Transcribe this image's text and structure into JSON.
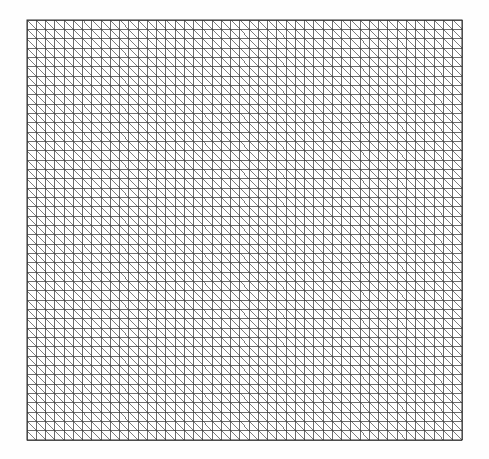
{
  "figure": {
    "title": "Triangular mesh grid",
    "background_color": "#fefefe",
    "canvas_width": 489,
    "canvas_height": 459
  },
  "mesh": {
    "name": "structured-triangular-mesh",
    "element_type": "right-triangle",
    "diagonal_direction": "top-left-to-bottom-right",
    "columns": 47,
    "rows": 45,
    "cell_width": 9.26,
    "cell_height": 9.33,
    "origin_x": 27,
    "origin_y": 20,
    "extent_x": 462,
    "extent_y": 440,
    "width_px": 435,
    "height_px": 420,
    "line_color": "#3a3a3a",
    "line_width": 0.75,
    "diagonal_color": "#454545",
    "diagonal_width": 0.7,
    "border_color": "#2e2e2e",
    "border_width": 1,
    "vertical_line_count": 48,
    "horizontal_line_count": 46,
    "diagonal_line_count": 2115,
    "triangle_count": 4230,
    "node_count": 2208
  },
  "chart_data": {
    "type": "mesh",
    "title": "Triangular mesh grid",
    "xlabel": "",
    "ylabel": "",
    "grid": true,
    "legend": null,
    "nx": 47,
    "ny": 45,
    "xlim": [
      0,
      47
    ],
    "ylim": [
      0,
      45
    ],
    "tick_labels_x": [],
    "tick_labels_y": [],
    "annotations": [],
    "series": [
      {
        "name": "vertical-grid-lines",
        "count": 48,
        "orientation": "vertical"
      },
      {
        "name": "horizontal-grid-lines",
        "count": 46,
        "orientation": "horizontal"
      },
      {
        "name": "cell-diagonals",
        "count": 2115,
        "orientation": "negative-slope"
      }
    ]
  }
}
